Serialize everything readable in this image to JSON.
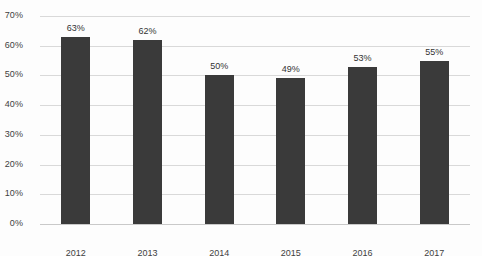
{
  "chart_data": {
    "type": "bar",
    "title": "",
    "subtitle": "",
    "xlabel": "",
    "ylabel": "",
    "categories": [
      "2012",
      "2013",
      "2014",
      "2015",
      "2016",
      "2017"
    ],
    "values": [
      63,
      62,
      50,
      49,
      53,
      55
    ],
    "data_labels": [
      "63%",
      "62%",
      "50%",
      "49%",
      "53%",
      "55%"
    ],
    "ylim": [
      0,
      70
    ],
    "ytick_values": [
      0,
      10,
      20,
      30,
      40,
      50,
      60,
      70
    ],
    "ytick_labels": [
      "0%",
      "10%",
      "20%",
      "30%",
      "40%",
      "50%",
      "60%",
      "70%"
    ],
    "grid": true,
    "grid_axis": "y",
    "legend": false,
    "legend_position": "none",
    "series": [
      {
        "name": "",
        "values": [
          63,
          62,
          50,
          49,
          53,
          55
        ]
      }
    ],
    "colors": {
      "bar": "#3a3a3a",
      "gridline": "#d9d9d9",
      "axis": "#c9c9c9",
      "tick_label": "#3f3f3f",
      "data_label": "#333333",
      "background": "#fdfdfd"
    }
  }
}
